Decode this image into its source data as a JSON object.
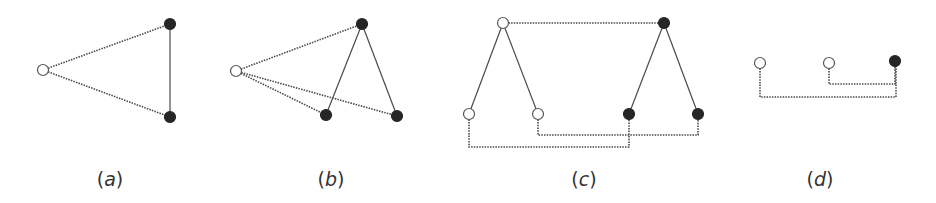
{
  "colors": {
    "stroke": "#4a4a4a",
    "filled": "#262626",
    "open": "#ffffff"
  },
  "panels": [
    {
      "label": "(a)",
      "label_x": 110,
      "label_y": 168,
      "nodes": [
        {
          "x": 43,
          "y": 70,
          "type": "open"
        },
        {
          "x": 170,
          "y": 24,
          "type": "filled"
        },
        {
          "x": 170,
          "y": 117,
          "type": "filled"
        }
      ],
      "edges": [
        {
          "pts": [
            [
              43,
              70
            ],
            [
              170,
              24
            ]
          ],
          "style": "dotted"
        },
        {
          "pts": [
            [
              43,
              70
            ],
            [
              170,
              117
            ]
          ],
          "style": "dotted"
        },
        {
          "pts": [
            [
              170,
              24
            ],
            [
              170,
              117
            ]
          ],
          "style": "solid"
        }
      ]
    },
    {
      "label": "(b)",
      "label_x": 331,
      "label_y": 168,
      "nodes": [
        {
          "x": 236,
          "y": 71,
          "type": "open"
        },
        {
          "x": 362,
          "y": 24,
          "type": "filled"
        },
        {
          "x": 326,
          "y": 115,
          "type": "filled"
        },
        {
          "x": 397,
          "y": 116,
          "type": "filled"
        }
      ],
      "edges": [
        {
          "pts": [
            [
              236,
              71
            ],
            [
              362,
              24
            ]
          ],
          "style": "dotted"
        },
        {
          "pts": [
            [
              236,
              71
            ],
            [
              326,
              115
            ]
          ],
          "style": "dotted"
        },
        {
          "pts": [
            [
              236,
              71
            ],
            [
              397,
              116
            ]
          ],
          "style": "dotted"
        },
        {
          "pts": [
            [
              362,
              24
            ],
            [
              326,
              115
            ]
          ],
          "style": "solid"
        },
        {
          "pts": [
            [
              362,
              24
            ],
            [
              397,
              116
            ]
          ],
          "style": "solid"
        }
      ]
    },
    {
      "label": "(c)",
      "label_x": 584,
      "label_y": 168,
      "nodes": [
        {
          "x": 503,
          "y": 23,
          "type": "open"
        },
        {
          "x": 664,
          "y": 23,
          "type": "filled"
        },
        {
          "x": 469,
          "y": 114,
          "type": "open"
        },
        {
          "x": 538,
          "y": 114,
          "type": "open"
        },
        {
          "x": 629,
          "y": 114,
          "type": "filled"
        },
        {
          "x": 698,
          "y": 114,
          "type": "filled"
        }
      ],
      "edges": [
        {
          "pts": [
            [
              503,
              23
            ],
            [
              664,
              23
            ]
          ],
          "style": "dotted"
        },
        {
          "pts": [
            [
              503,
              23
            ],
            [
              469,
              114
            ]
          ],
          "style": "solid"
        },
        {
          "pts": [
            [
              503,
              23
            ],
            [
              538,
              114
            ]
          ],
          "style": "solid"
        },
        {
          "pts": [
            [
              664,
              23
            ],
            [
              629,
              114
            ]
          ],
          "style": "solid"
        },
        {
          "pts": [
            [
              664,
              23
            ],
            [
              698,
              114
            ]
          ],
          "style": "solid"
        },
        {
          "pts": [
            [
              538,
              114
            ],
            [
              538,
              135
            ],
            [
              698,
              135
            ],
            [
              698,
              114
            ]
          ],
          "style": "dotted"
        },
        {
          "pts": [
            [
              469,
              114
            ],
            [
              469,
              147
            ],
            [
              629,
              147
            ],
            [
              629,
              114
            ]
          ],
          "style": "dotted"
        }
      ]
    },
    {
      "label": "(d)",
      "label_x": 820,
      "label_y": 168,
      "nodes": [
        {
          "x": 760,
          "y": 63,
          "type": "open"
        },
        {
          "x": 829,
          "y": 63,
          "type": "open"
        },
        {
          "x": 895,
          "y": 61,
          "type": "filled"
        }
      ],
      "edges": [
        {
          "pts": [
            [
              829,
              63
            ],
            [
              829,
              84
            ],
            [
              895,
              84
            ],
            [
              895,
              61
            ]
          ],
          "style": "dotted"
        },
        {
          "pts": [
            [
              760,
              63
            ],
            [
              760,
              97
            ],
            [
              896,
              97
            ],
            [
              896,
              61
            ]
          ],
          "style": "dotted"
        }
      ]
    }
  ]
}
